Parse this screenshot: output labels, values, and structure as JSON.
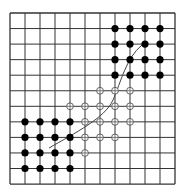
{
  "figure": {
    "grid": {
      "origin_x": 10,
      "origin_y": 13,
      "columns": 11,
      "rows": 11,
      "cell_w": 15,
      "cell_h": 15.55,
      "line_color": "#333333"
    },
    "filled_dots": {
      "color": "#000000",
      "radius": 3.6,
      "points": [
        [
          1,
          7
        ],
        [
          2,
          7
        ],
        [
          3,
          7
        ],
        [
          4,
          7
        ],
        [
          1,
          8
        ],
        [
          2,
          8
        ],
        [
          3,
          8
        ],
        [
          4,
          8
        ],
        [
          1,
          9
        ],
        [
          2,
          9
        ],
        [
          3,
          9
        ],
        [
          4,
          9
        ],
        [
          1,
          10
        ],
        [
          2,
          10
        ],
        [
          3,
          10
        ],
        [
          4,
          10
        ],
        [
          7,
          1
        ],
        [
          8,
          1
        ],
        [
          9,
          1
        ],
        [
          10,
          1
        ],
        [
          7,
          2
        ],
        [
          8,
          2
        ],
        [
          9,
          2
        ],
        [
          10,
          2
        ],
        [
          7,
          3
        ],
        [
          8,
          3
        ],
        [
          9,
          3
        ],
        [
          10,
          3
        ],
        [
          7,
          4
        ],
        [
          8,
          4
        ],
        [
          9,
          4
        ],
        [
          10,
          4
        ]
      ]
    },
    "open_circles": {
      "color": "#555555",
      "radius": 3.4,
      "points": [
        [
          6,
          5
        ],
        [
          7,
          5
        ],
        [
          8,
          5
        ],
        [
          4,
          6
        ],
        [
          5,
          6
        ],
        [
          6,
          6
        ],
        [
          7,
          6
        ],
        [
          8,
          6
        ],
        [
          5,
          7
        ],
        [
          6,
          7
        ],
        [
          7,
          7
        ],
        [
          8,
          7
        ],
        [
          5,
          8
        ],
        [
          6,
          8
        ],
        [
          7,
          8
        ],
        [
          5,
          9
        ]
      ]
    },
    "curve": {
      "color": "#444444",
      "path": "M 49 148 C 75 133, 105 118, 113 100 S 126 58, 142 45"
    },
    "caption": ""
  }
}
